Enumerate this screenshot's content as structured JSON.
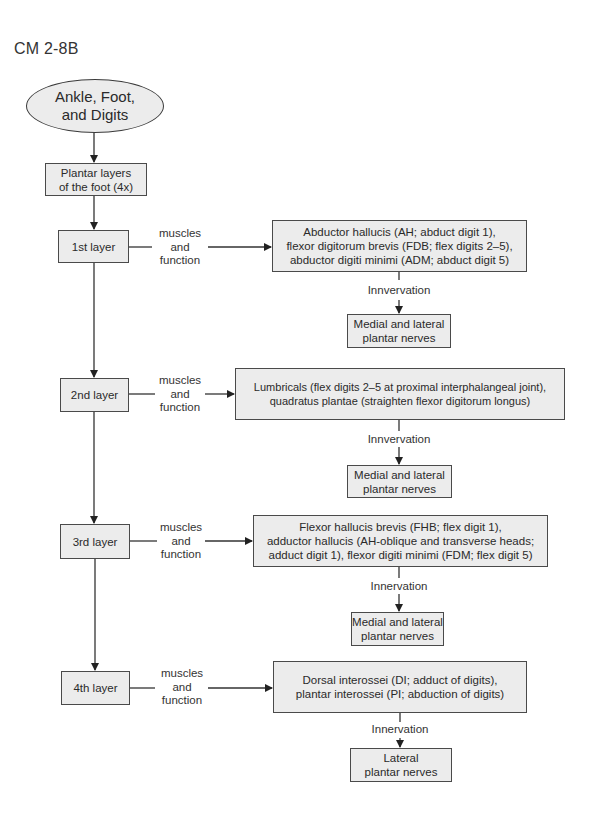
{
  "figure_label": "CM 2-8B",
  "root": {
    "label": "Ankle, Foot,\nand Digits"
  },
  "overview": {
    "label": "Plantar layers\nof the foot (4x)"
  },
  "connector_label": "muscles\nand\nfunction",
  "innervation_label": "Innervation",
  "layers": [
    {
      "name": "1st layer",
      "muscles": "Abductor hallucis (AH; abduct digit 1),\nflexor digitorum brevis (FDB; flex digits 2–5),\nabductor digiti minimi (ADM; abduct digit 5)",
      "innervation_label": "Innvervation",
      "nerves": "Medial and lateral\nplantar nerves"
    },
    {
      "name": "2nd layer",
      "muscles": "Lumbricals (flex digits 2–5 at proximal interphalangeal joint),\nquadratus plantae (straighten flexor digitorum longus)",
      "innervation_label": "Innvervation",
      "nerves": "Medial and lateral\nplantar nerves"
    },
    {
      "name": "3rd layer",
      "muscles": "Flexor hallucis brevis (FHB; flex digit 1),\nadductor hallucis (AH-oblique and transverse heads;\nadduct digit 1), flexor digiti minimi (FDM; flex digit 5)",
      "innervation_label": "Innervation",
      "nerves": "Medial and lateral\nplantar nerves"
    },
    {
      "name": "4th layer",
      "muscles": "Dorsal interossei (DI; adduct of digits),\nplantar interossei (PI; abduction of digits)",
      "innervation_label": "Innervation",
      "nerves": "Lateral\nplantar nerves"
    }
  ],
  "colors": {
    "box_fill": "#ececec",
    "line": "#3a3a3a",
    "background": "#ffffff"
  }
}
